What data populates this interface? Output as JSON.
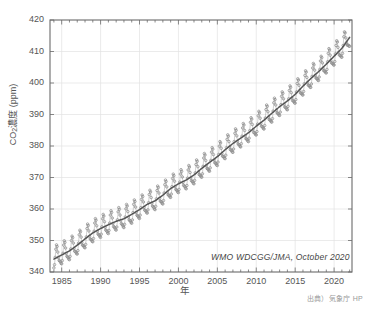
{
  "chart_data": {
    "type": "line",
    "title": "",
    "xlabel": "年",
    "ylabel": "CO2濃度（ppm）",
    "ylabel_main": "濃度 (ppm)",
    "ylabel_species": "CO",
    "ylabel_subscript": "2",
    "yunit": "ppm",
    "xlim": [
      1983.5,
      2022.3
    ],
    "ylim": [
      340,
      420
    ],
    "xticks": [
      1985,
      1990,
      1995,
      2000,
      2005,
      2010,
      2015,
      2020
    ],
    "xtick_labels": [
      "1985",
      "1990",
      "1995",
      "2000",
      "2005",
      "2010",
      "2015",
      "2020"
    ],
    "yticks": [
      340,
      350,
      360,
      370,
      380,
      390,
      400,
      410,
      420
    ],
    "ytick_labels": [
      "340",
      "350",
      "360",
      "370",
      "380",
      "390",
      "400",
      "410",
      "420"
    ],
    "x_minor_tick_interval": 1,
    "grid": true,
    "grid_color": "#e3e3e3",
    "legend": "none",
    "annotation": "WMO WDCGG/JMA, October 2020",
    "annotation_x": 2004.2,
    "annotation_y": 344.0,
    "source_note": "出典）気象庁 HP",
    "series": [
      {
        "name": "monthly-mean",
        "style": "markers",
        "color": "#8d8d8d",
        "description": "月平均値（季節変動を含む）",
        "seasonal_amplitude_ppm": 3.1,
        "seasonal_peak_month": 5,
        "seasonal_min_month": 9
      },
      {
        "name": "trend",
        "style": "line",
        "color": "#555555",
        "description": "季節変動を除いた長期変化傾向"
      }
    ],
    "x": [
      1984.0,
      1985.0,
      1986.0,
      1987.0,
      1988.0,
      1989.0,
      1990.0,
      1991.0,
      1992.0,
      1993.0,
      1994.0,
      1995.0,
      1996.0,
      1997.0,
      1998.0,
      1999.0,
      2000.0,
      2001.0,
      2002.0,
      2003.0,
      2004.0,
      2005.0,
      2006.0,
      2007.0,
      2008.0,
      2009.0,
      2010.0,
      2011.0,
      2012.0,
      2013.0,
      2014.0,
      2015.0,
      2016.0,
      2017.0,
      2018.0,
      2019.0,
      2020.0,
      2021.0,
      2022.0
    ],
    "trend_values": [
      344.1,
      345.4,
      346.7,
      348.5,
      350.5,
      352.4,
      353.8,
      355.0,
      356.1,
      356.9,
      358.3,
      359.8,
      361.5,
      362.6,
      364.4,
      366.5,
      368.0,
      369.2,
      370.8,
      372.9,
      374.8,
      376.6,
      378.8,
      380.8,
      382.5,
      384.2,
      386.3,
      388.2,
      390.4,
      392.5,
      394.3,
      396.4,
      399.0,
      401.4,
      403.6,
      406.0,
      408.5,
      411.0,
      414.5
    ],
    "last_value_ppm": 417.0,
    "first_value_ppm": 344.0
  }
}
